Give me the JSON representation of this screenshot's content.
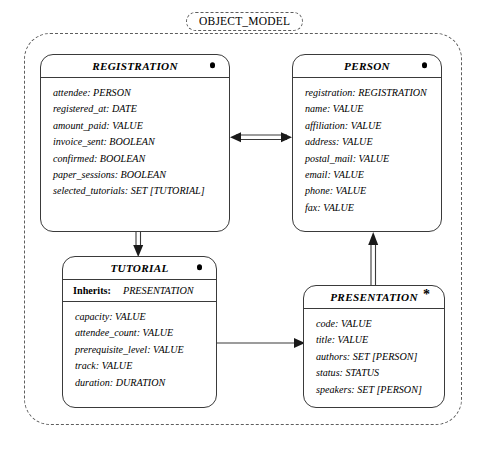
{
  "diagram": {
    "title": "OBJECT_MODEL",
    "classes": [
      {
        "id": "registration",
        "name": "REGISTRATION",
        "marker": "dot",
        "attributes": [
          {
            "name": "attendee",
            "type": "PERSON"
          },
          {
            "name": "registered_at",
            "type": "DATE"
          },
          {
            "name": "amount_paid",
            "type": "VALUE"
          },
          {
            "name": "invoice_sent",
            "type": "BOOLEAN"
          },
          {
            "name": "confirmed",
            "type": "BOOLEAN"
          },
          {
            "name": "paper_sessions",
            "type": "BOOLEAN"
          },
          {
            "name": "selected_tutorials",
            "type": "SET [TUTORIAL]"
          }
        ]
      },
      {
        "id": "person",
        "name": "PERSON",
        "marker": "dot",
        "attributes": [
          {
            "name": "registration",
            "type": "REGISTRATION"
          },
          {
            "name": "name",
            "type": "VALUE"
          },
          {
            "name": "affiliation",
            "type": "VALUE"
          },
          {
            "name": "address",
            "type": "VALUE"
          },
          {
            "name": "postal_mail",
            "type": "VALUE"
          },
          {
            "name": "email",
            "type": "VALUE"
          },
          {
            "name": "phone",
            "type": "VALUE"
          },
          {
            "name": "fax",
            "type": "VALUE"
          }
        ]
      },
      {
        "id": "tutorial",
        "name": "TUTORIAL",
        "marker": "dot",
        "inherits_label": "Inherits:",
        "inherits_value": "PRESENTATION",
        "attributes": [
          {
            "name": "capacity",
            "type": "VALUE"
          },
          {
            "name": "attendee_count",
            "type": "VALUE"
          },
          {
            "name": "prerequisite_level",
            "type": "VALUE"
          },
          {
            "name": "track",
            "type": "VALUE"
          },
          {
            "name": "duration",
            "type": "DURATION"
          }
        ]
      },
      {
        "id": "presentation",
        "name": "PRESENTATION",
        "marker": "star",
        "marker_glyph": "*",
        "attributes": [
          {
            "name": "code",
            "type": "VALUE"
          },
          {
            "name": "title",
            "type": "VALUE"
          },
          {
            "name": "authors",
            "type": "SET [PERSON]"
          },
          {
            "name": "status",
            "type": "STATUS"
          },
          {
            "name": "speakers",
            "type": "SET [PERSON]"
          }
        ]
      }
    ],
    "connectors": [
      {
        "id": "registration-person",
        "from": "REGISTRATION",
        "to": "PERSON",
        "style": "double-line",
        "arrows": "both"
      },
      {
        "id": "registration-tutorial",
        "from": "REGISTRATION",
        "to": "TUTORIAL",
        "style": "double-line",
        "arrows": "end"
      },
      {
        "id": "presentation-person",
        "from": "PRESENTATION",
        "to": "PERSON",
        "style": "double-line",
        "arrows": "end"
      },
      {
        "id": "tutorial-presentation",
        "from": "TUTORIAL",
        "to": "PRESENTATION",
        "style": "single-line",
        "arrows": "end"
      }
    ],
    "colors": {
      "stroke": "#3a3a3a",
      "frame_stroke": "#5d5d5d",
      "background": "#ffffff",
      "text": "#000000"
    }
  }
}
